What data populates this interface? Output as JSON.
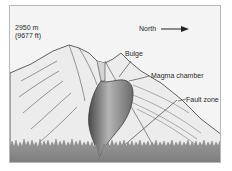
{
  "diagram": {
    "elevation": {
      "meters": "2950 m",
      "feet": "(9677 ft)"
    },
    "direction": {
      "label": "North",
      "arrow": "right-arrow-icon"
    },
    "labels": {
      "bulge": "Bulge",
      "magma_chamber": "Magma chamber",
      "fault_zone": "Fault zone"
    },
    "colors": {
      "background": "#f4f4f4",
      "mountain_fill": "#ececec",
      "outline": "#3a3a3a",
      "magma_dark": "#5a5a5a",
      "magma_light": "#bdbdbd",
      "forest": "#8a8a8a",
      "frame_border": "#b8b8b8"
    }
  }
}
